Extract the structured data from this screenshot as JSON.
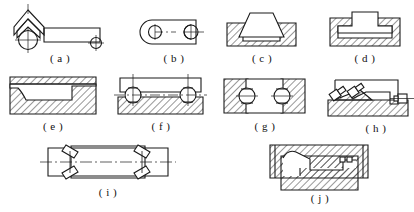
{
  "figure": {
    "title": "",
    "background_color": "#ffffff",
    "line_color": "#1a1a1a",
    "hatch_color": "#1a1a1a",
    "width": 414,
    "height": 212
  },
  "captions": [
    {
      "id": "a",
      "label": "( a )"
    },
    {
      "id": "b",
      "label": "( b )"
    },
    {
      "id": "c",
      "label": "( c )"
    },
    {
      "id": "d",
      "label": "( d )"
    },
    {
      "id": "e",
      "label": "( e )"
    },
    {
      "id": "f",
      "label": "( f )"
    },
    {
      "id": "g",
      "label": "( g )"
    },
    {
      "id": "h",
      "label": "( h )"
    },
    {
      "id": "i",
      "label": "( i )"
    },
    {
      "id": "j",
      "label": "( j )"
    }
  ],
  "panels": [
    {
      "id": "a",
      "description": "chevron bracket with circular bolt head at left, long horizontal bar, small bolt circle at right end",
      "caption": "( a )"
    },
    {
      "id": "b",
      "description": "flat link bar with rounded left end, circle bolt at left, circle bolt overlapping right end",
      "caption": "( b )"
    },
    {
      "id": "c",
      "description": "hatched block with trapezoidal countersunk piece seated in recess",
      "caption": "( c )"
    },
    {
      "id": "d",
      "description": "hatched block with T-head piece in rectangular recess",
      "caption": "( d )"
    },
    {
      "id": "e",
      "description": "hatched block with stepped and curved profile cut, thin top plate",
      "caption": "( e )"
    },
    {
      "id": "f",
      "description": "plate on hatched base joined by two round bolts with centre marks",
      "caption": "( f )"
    },
    {
      "id": "g",
      "description": "two hatched side blocks with central rectangular piece and two round bolts",
      "caption": "( g )"
    },
    {
      "id": "h",
      "description": "hatched base with angular bracket, diagonal bolts at left, bolt at right",
      "caption": "( h )"
    },
    {
      "id": "i",
      "description": "horizontal shaft with centreline and two pairs of diagonal keys",
      "caption": "( i )"
    },
    {
      "id": "j",
      "description": "hatched assembly of upper and lower blocks with stepped internal profile",
      "caption": "( j )"
    }
  ]
}
